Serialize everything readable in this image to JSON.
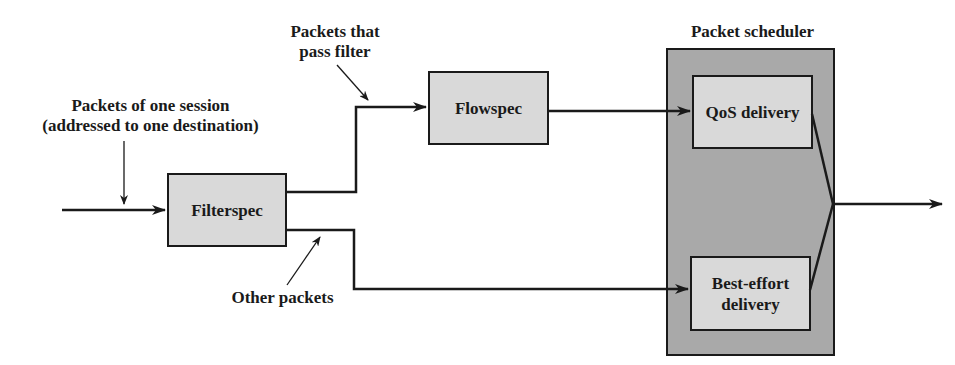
{
  "diagram": {
    "labels": {
      "session_line1": "Packets of one session",
      "session_line2": "(addressed to one destination)",
      "pass_line1": "Packets that",
      "pass_line2": "pass filter",
      "other": "Other packets",
      "scheduler_title": "Packet scheduler"
    },
    "boxes": {
      "filterspec": "Filterspec",
      "flowspec": "Flowspec",
      "qos": "QoS delivery",
      "best_effort_line1": "Best-effort",
      "best_effort_line2": "delivery"
    },
    "colors": {
      "box_fill": "#d9d9d9",
      "scheduler_fill": "#a9a9a9",
      "stroke": "#1a1a1a"
    }
  }
}
